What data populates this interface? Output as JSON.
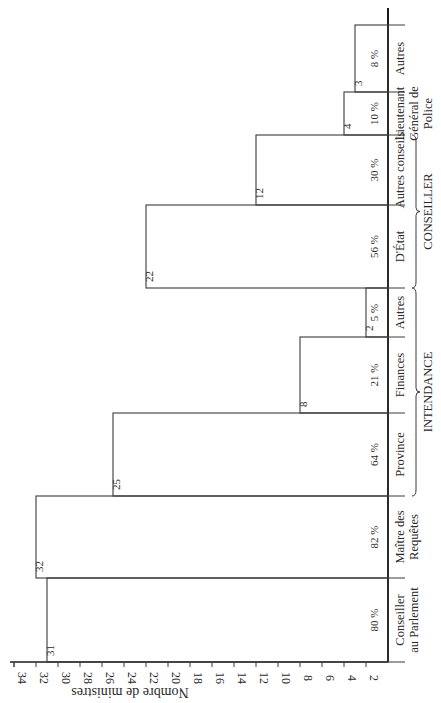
{
  "chart_data": {
    "type": "bar",
    "orientation": "rotated-90",
    "title": "",
    "ylabel": "Nombre de ministres",
    "xlabel": "",
    "ylim": [
      0,
      34
    ],
    "yticks": [
      2,
      4,
      6,
      8,
      10,
      12,
      14,
      16,
      18,
      20,
      22,
      24,
      26,
      28,
      30,
      32,
      34
    ],
    "grid": false,
    "categories": [
      "Conseiller au Parlement",
      "Maître des Requêtes",
      "Province",
      "Finances",
      "Autres",
      "D'État",
      "Autres conseils",
      "Lieutenant Général de Police",
      "Autres"
    ],
    "category_lines": [
      [
        "Conseiller",
        "au Parlement"
      ],
      [
        "Maître des",
        "Requêtes"
      ],
      [
        "Province"
      ],
      [
        "Finances"
      ],
      [
        "Autres"
      ],
      [
        "D'État"
      ],
      [
        "Autres conseils"
      ],
      [
        "Lieutenant",
        "Général de",
        "Police"
      ],
      [
        "Autres"
      ]
    ],
    "groups": [
      {
        "label": "INTENDANCE",
        "categories": [
          "Province",
          "Finances",
          "Autres"
        ]
      },
      {
        "label": "CONSEILLER",
        "categories": [
          "D'État",
          "Autres conseils"
        ]
      }
    ],
    "values": [
      31,
      32,
      25,
      8,
      2,
      22,
      12,
      4,
      3
    ],
    "value_labels": [
      "31",
      "32",
      "25",
      "8",
      "2",
      "22",
      "12",
      "4",
      "3"
    ],
    "percent_labels": [
      "80 %",
      "82 %",
      "64 %",
      "21 %",
      "5 %",
      "56 %",
      "30 %",
      "10 %",
      "8 %"
    ]
  }
}
